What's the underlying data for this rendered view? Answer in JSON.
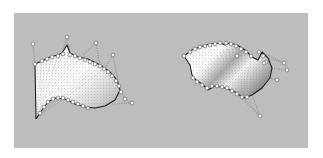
{
  "viewport": {
    "background": "#bdbdbd",
    "page_background": "#ffffff",
    "description": "Two shaded NURBS surfaces shown with control points and control polygon"
  },
  "colors": {
    "edge": "#1e1e1e",
    "surface_light": "#ffffff",
    "surface_dark": "#8a8a8a",
    "control_point_fill": "#f4f4f4",
    "control_point_stroke": "#5a5a5a",
    "hull_line": "#6e6e6e"
  },
  "surfaces": [
    {
      "name": "left-surface",
      "outline": [
        [
          36,
          119
        ],
        [
          35,
          64
        ],
        [
          42,
          61
        ],
        [
          50,
          57
        ],
        [
          58,
          55
        ],
        [
          62,
          53
        ],
        [
          67,
          45
        ],
        [
          70,
          53
        ],
        [
          78,
          57
        ],
        [
          88,
          59
        ],
        [
          100,
          65
        ],
        [
          110,
          72
        ],
        [
          117,
          80
        ],
        [
          120,
          90
        ],
        [
          115,
          100
        ],
        [
          105,
          106
        ],
        [
          95,
          108
        ],
        [
          85,
          107
        ],
        [
          75,
          104
        ],
        [
          65,
          99
        ],
        [
          55,
          98
        ],
        [
          48,
          102
        ],
        [
          42,
          110
        ],
        [
          36,
          119
        ]
      ],
      "edge_points": [
        [
          35,
          64
        ],
        [
          42,
          61
        ],
        [
          47,
          59
        ],
        [
          52,
          57
        ],
        [
          58,
          56
        ],
        [
          63,
          54
        ],
        [
          70,
          55
        ],
        [
          75,
          56
        ],
        [
          80,
          58
        ],
        [
          85,
          60
        ],
        [
          90,
          62
        ],
        [
          95,
          64
        ],
        [
          100,
          66
        ],
        [
          104,
          69
        ],
        [
          108,
          72
        ],
        [
          112,
          76
        ],
        [
          116,
          81
        ],
        [
          119,
          86
        ],
        [
          121,
          92
        ],
        [
          40,
          113
        ],
        [
          44,
          107
        ],
        [
          48,
          102
        ],
        [
          53,
          99
        ],
        [
          58,
          98
        ],
        [
          63,
          98
        ],
        [
          68,
          100
        ],
        [
          73,
          102
        ],
        [
          78,
          104
        ],
        [
          83,
          106
        ],
        [
          88,
          108
        ]
      ],
      "outer_points": [
        [
          33,
          44
        ],
        [
          67,
          37
        ],
        [
          96,
          43
        ],
        [
          113,
          55
        ],
        [
          125,
          99
        ],
        [
          132,
          103
        ]
      ],
      "hull_segments": [
        [
          [
            33,
            44
          ],
          [
            35,
            64
          ]
        ],
        [
          [
            67,
            37
          ],
          [
            62,
            53
          ]
        ],
        [
          [
            67,
            37
          ],
          [
            70,
            53
          ]
        ],
        [
          [
            96,
            43
          ],
          [
            80,
            58
          ]
        ],
        [
          [
            96,
            43
          ],
          [
            100,
            66
          ]
        ],
        [
          [
            113,
            55
          ],
          [
            104,
            69
          ]
        ],
        [
          [
            113,
            55
          ],
          [
            119,
            86
          ]
        ],
        [
          [
            125,
            99
          ],
          [
            121,
            92
          ]
        ],
        [
          [
            132,
            103
          ],
          [
            125,
            99
          ]
        ],
        [
          [
            132,
            103
          ],
          [
            112,
            104
          ]
        ]
      ]
    },
    {
      "name": "right-surface",
      "outline": [
        [
          184,
          56
        ],
        [
          192,
          50
        ],
        [
          200,
          47
        ],
        [
          210,
          44
        ],
        [
          220,
          43
        ],
        [
          225,
          45
        ],
        [
          230,
          43
        ],
        [
          237,
          45
        ],
        [
          245,
          50
        ],
        [
          252,
          57
        ],
        [
          258,
          60
        ],
        [
          262,
          52
        ],
        [
          268,
          58
        ],
        [
          272,
          68
        ],
        [
          270,
          78
        ],
        [
          262,
          88
        ],
        [
          252,
          95
        ],
        [
          244,
          98
        ],
        [
          235,
          92
        ],
        [
          225,
          88
        ],
        [
          215,
          86
        ],
        [
          208,
          90
        ],
        [
          202,
          84
        ],
        [
          196,
          80
        ],
        [
          192,
          75
        ],
        [
          190,
          65
        ],
        [
          184,
          56
        ]
      ],
      "edge_points": [
        [
          184,
          56
        ],
        [
          190,
          52
        ],
        [
          195,
          49
        ],
        [
          200,
          47
        ],
        [
          205,
          46
        ],
        [
          210,
          45
        ],
        [
          215,
          44
        ],
        [
          220,
          43
        ],
        [
          226,
          43
        ],
        [
          231,
          44
        ],
        [
          236,
          46
        ],
        [
          241,
          49
        ],
        [
          246,
          52
        ],
        [
          251,
          56
        ],
        [
          259,
          52
        ],
        [
          263,
          56
        ],
        [
          266,
          62
        ],
        [
          193,
          78
        ],
        [
          197,
          82
        ],
        [
          202,
          85
        ],
        [
          207,
          88
        ],
        [
          212,
          86
        ],
        [
          217,
          86
        ],
        [
          222,
          87
        ],
        [
          227,
          88
        ],
        [
          232,
          91
        ],
        [
          237,
          94
        ],
        [
          242,
          97
        ],
        [
          247,
          97
        ]
      ],
      "outer_points": [
        [
          260,
          116
        ],
        [
          284,
          63
        ],
        [
          287,
          70
        ],
        [
          277,
          80
        ],
        [
          237,
          56
        ],
        [
          264,
          63
        ]
      ],
      "hull_segments": [
        [
          [
            260,
            116
          ],
          [
            244,
            98
          ]
        ],
        [
          [
            260,
            116
          ],
          [
            252,
            95
          ]
        ],
        [
          [
            260,
            116
          ],
          [
            235,
            92
          ]
        ],
        [
          [
            284,
            63
          ],
          [
            268,
            58
          ]
        ],
        [
          [
            287,
            70
          ],
          [
            272,
            68
          ]
        ],
        [
          [
            277,
            80
          ],
          [
            270,
            78
          ]
        ],
        [
          [
            284,
            63
          ],
          [
            287,
            70
          ]
        ],
        [
          [
            262,
            52
          ],
          [
            284,
            63
          ]
        ]
      ]
    }
  ]
}
